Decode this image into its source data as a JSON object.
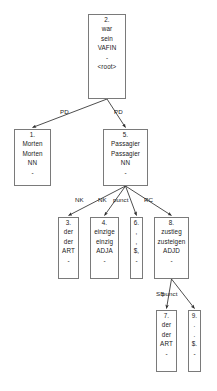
{
  "graph": {
    "kind": "dependency-parse-tree",
    "nodes": [
      {
        "id": "n2",
        "index": "2.",
        "form": "war",
        "lemma": "sein",
        "pos": "VAFIN",
        "morph": "-",
        "extra": "<root>",
        "x": 88,
        "y": 14,
        "w": 38,
        "h": 85
      },
      {
        "id": "n1",
        "index": "1.",
        "form": "Morten",
        "lemma": "Morten",
        "pos": "NN",
        "morph": "-",
        "extra": "",
        "x": 14,
        "y": 129,
        "w": 37,
        "h": 57
      },
      {
        "id": "n5",
        "index": "5.",
        "form": "Passagier",
        "lemma": "Passagier",
        "pos": "NN",
        "morph": "-",
        "extra": "",
        "x": 103,
        "y": 129,
        "w": 45,
        "h": 57
      },
      {
        "id": "n3",
        "index": "3.",
        "form": "der",
        "lemma": "der",
        "pos": "ART",
        "morph": "-",
        "extra": "",
        "x": 58,
        "y": 217,
        "w": 21,
        "h": 62
      },
      {
        "id": "n4",
        "index": "4.",
        "form": "einzige",
        "lemma": "einzig",
        "pos": "ADJA",
        "morph": "-",
        "extra": "",
        "x": 90,
        "y": 217,
        "w": 29,
        "h": 62
      },
      {
        "id": "n6",
        "index": "6.",
        "form": ",",
        "lemma": ",",
        "pos": "$,",
        "morph": "-",
        "extra": "",
        "x": 130,
        "y": 217,
        "w": 13,
        "h": 62
      },
      {
        "id": "n8",
        "index": "8.",
        "form": "zustieg",
        "lemma": "zusteigen",
        "pos": "ADJD",
        "morph": "-",
        "extra": "",
        "x": 154,
        "y": 217,
        "w": 35,
        "h": 62
      },
      {
        "id": "n7",
        "index": "7.",
        "form": "der",
        "lemma": "der",
        "pos": "ART",
        "morph": "-",
        "extra": "",
        "x": 156,
        "y": 310,
        "w": 21,
        "h": 62
      },
      {
        "id": "n9",
        "index": "9.",
        "form": ".",
        "lemma": ".",
        "pos": "$.",
        "morph": "-",
        "extra": "",
        "x": 188,
        "y": 310,
        "w": 13,
        "h": 62
      }
    ],
    "edges": [
      {
        "id": "e-2-1",
        "from": "n2",
        "to": "n1",
        "label": "PD",
        "lx": 60,
        "ly": 108
      },
      {
        "id": "e-2-5",
        "from": "n2",
        "to": "n5",
        "label": "PD",
        "lx": 114,
        "ly": 108
      },
      {
        "id": "e-5-3",
        "from": "n5",
        "to": "n3",
        "label": "NK",
        "lx": 75,
        "ly": 196
      },
      {
        "id": "e-5-4",
        "from": "n5",
        "to": "n4",
        "label": "NK",
        "lx": 98,
        "ly": 196
      },
      {
        "id": "e-5-6",
        "from": "n5",
        "to": "n6",
        "label": "punct",
        "lx": 113,
        "ly": 196
      },
      {
        "id": "e-5-8",
        "from": "n5",
        "to": "n8",
        "label": "RC",
        "lx": 144,
        "ly": 196
      },
      {
        "id": "e-8-7",
        "from": "n8",
        "to": "n7",
        "label": "SB",
        "lx": 156,
        "ly": 290
      },
      {
        "id": "e-8-9",
        "from": "n8",
        "to": "n9",
        "label": "punct",
        "lx": 162,
        "ly": 290
      }
    ],
    "colors": {
      "node_border": "#7a7a7a",
      "edge_stroke": "#3a3a3a",
      "text": "#1a1a1a",
      "background": "#ffffff"
    }
  }
}
